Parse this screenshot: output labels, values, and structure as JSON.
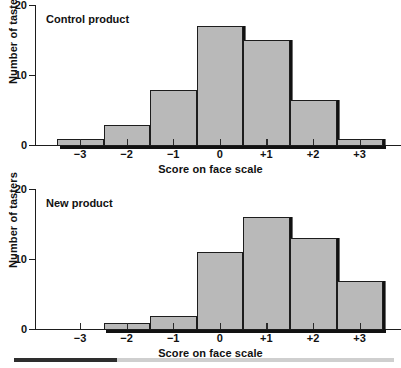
{
  "figure": {
    "panels": [
      {
        "id": "control",
        "title": "Control product",
        "xlabel": "Score on face scale",
        "ylabel": "Number of tasters"
      },
      {
        "id": "new",
        "title": "New product",
        "xlabel": "Score on face scale",
        "ylabel": "Number of tasters"
      }
    ],
    "y_ticks": [
      "0",
      "10",
      "20"
    ],
    "x_ticks": [
      "−3",
      "−2",
      "−1",
      "0",
      "+1",
      "+2",
      "+3"
    ],
    "footer": {
      "progress_percent": 27
    },
    "colors": {
      "bar_fill": "#b9b9b9",
      "bar_edge": "#1d1d1d",
      "axis": "#1d1d1d",
      "text": "#111111",
      "footer_fill": "#2e2e2e",
      "footer_track": "#cfcfcf"
    }
  },
  "chart_data": [
    {
      "type": "bar",
      "title": "Control product",
      "xlabel": "Score on face scale",
      "ylabel": "Number of tasters",
      "categories": [
        "−3",
        "−2",
        "−1",
        "0",
        "+1",
        "+2",
        "+3"
      ],
      "values": [
        1,
        3,
        8,
        17,
        15,
        6.5,
        1
      ],
      "ylim": [
        0,
        20
      ],
      "yticks": [
        0,
        10,
        20
      ],
      "grid": false,
      "legend": "none"
    },
    {
      "type": "bar",
      "title": "New product",
      "xlabel": "Score on face scale",
      "ylabel": "Number of tasters",
      "categories": [
        "−3",
        "−2",
        "−1",
        "0",
        "+1",
        "+2",
        "+3"
      ],
      "values": [
        0,
        1,
        2,
        11,
        16,
        13,
        7
      ],
      "ylim": [
        0,
        20
      ],
      "yticks": [
        0,
        10,
        20
      ],
      "grid": false,
      "legend": "none"
    }
  ]
}
